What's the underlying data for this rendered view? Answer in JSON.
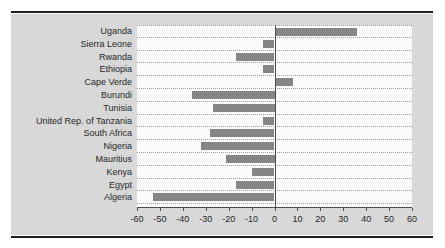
{
  "chart_data": {
    "type": "bar",
    "orientation": "horizontal",
    "title": "",
    "xlabel": "",
    "ylabel": "",
    "categories": [
      "Uganda",
      "Sierra Leone",
      "Rwanda",
      "Ethiopia",
      "Cape Verde",
      "Burundi",
      "Tunisia",
      "United Rep. of Tanzania",
      "South Africa",
      "Nigeria",
      "Mauritius",
      "Kenya",
      "Egypt",
      "Algeria"
    ],
    "values": [
      36,
      -5,
      -17,
      -5,
      8,
      -36,
      -27,
      -5,
      -28,
      -32,
      -21,
      -10,
      -17,
      -53
    ],
    "xlim": [
      -60,
      60
    ],
    "xticks": [
      -60,
      -50,
      -40,
      -30,
      -20,
      -10,
      0,
      10,
      20,
      30,
      40,
      50,
      60
    ],
    "grid": "dotted horizontal row separators",
    "legend": "none",
    "zero_line": true
  },
  "colors": {
    "page_bg": "#ffffff",
    "rule": "#1f1f1f",
    "panel_bg": "#d8d8d8",
    "plot_bg": "#fbfbfb",
    "bar": "#868686",
    "gridline": "#9c9c9c",
    "axis_line": "#4d4d4d",
    "text": "#262626"
  }
}
